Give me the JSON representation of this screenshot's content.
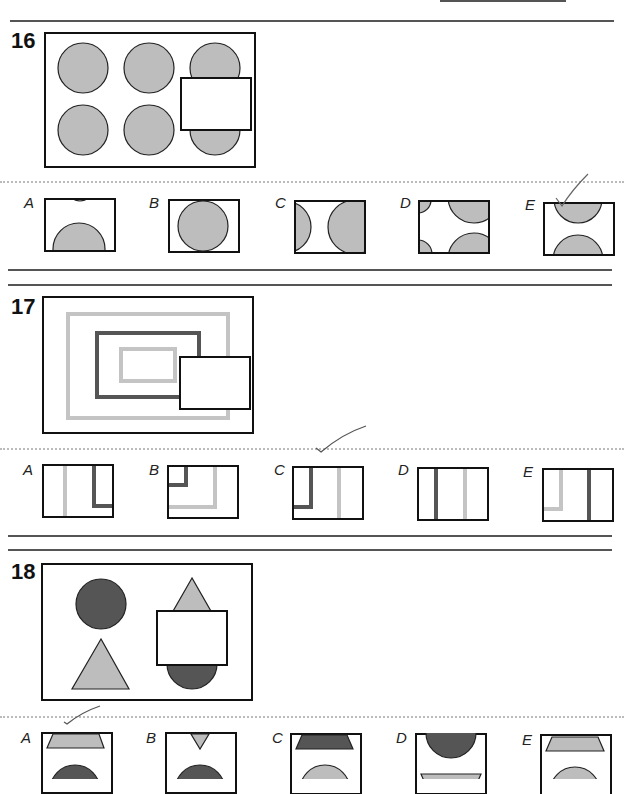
{
  "colors": {
    "light_grey": "#bdbdbd",
    "dark_grey": "#555555",
    "border": "#111111",
    "tick_mark": "#555555"
  },
  "questions": [
    {
      "number": "16",
      "options": [
        {
          "label": "A"
        },
        {
          "label": "B"
        },
        {
          "label": "C"
        },
        {
          "label": "D"
        },
        {
          "label": "E"
        }
      ],
      "marked_answer": "E"
    },
    {
      "number": "17",
      "options": [
        {
          "label": "A"
        },
        {
          "label": "B"
        },
        {
          "label": "C"
        },
        {
          "label": "D"
        },
        {
          "label": "E"
        }
      ],
      "marked_answer": "C"
    },
    {
      "number": "18",
      "options": [
        {
          "label": "A"
        },
        {
          "label": "B"
        },
        {
          "label": "C"
        },
        {
          "label": "D"
        },
        {
          "label": "E"
        }
      ],
      "marked_answer": "A"
    }
  ]
}
